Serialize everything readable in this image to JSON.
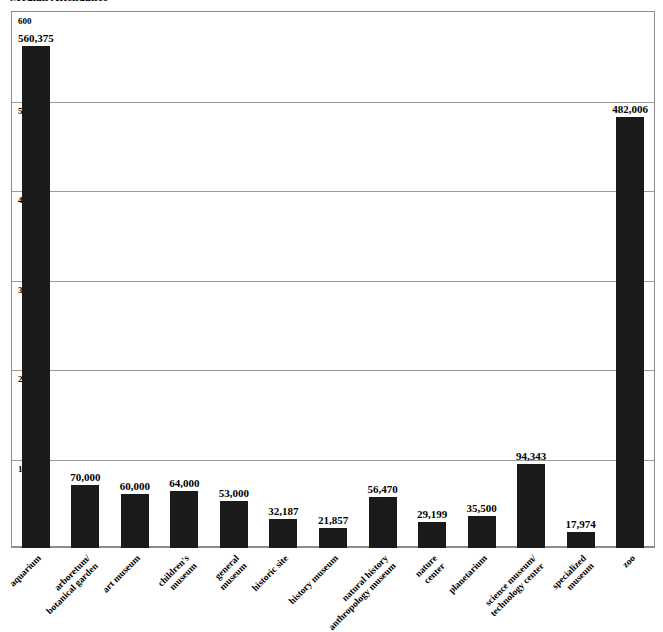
{
  "chart_data": {
    "type": "bar",
    "title": "Median Attendance",
    "xlabel": "",
    "ylabel": "",
    "ylim": [
      0,
      600
    ],
    "y_unit": "thousands",
    "grid": true,
    "legend": "none",
    "y_ticks": [
      "100",
      "200",
      "300",
      "400",
      "500",
      "600"
    ],
    "y_tick_values": [
      100,
      200,
      300,
      400,
      500,
      600
    ],
    "bar_color": "#1a1a1a",
    "categories": [
      "aquarium",
      "arboretum/ botanical garden",
      "art museum",
      "children's museum",
      "general museum",
      "historic site",
      "history museum",
      "natural history anthropology museum",
      "nature center",
      "planetarium",
      "science museum/ technology center",
      "specialized museum",
      "zoo"
    ],
    "category_lines": [
      [
        "aquarium"
      ],
      [
        "arboretum/",
        "botanical garden"
      ],
      [
        "art museum"
      ],
      [
        "children's",
        "museum"
      ],
      [
        "general",
        "museum"
      ],
      [
        "historic site"
      ],
      [
        "history museum"
      ],
      [
        "natural history",
        "anthropology museum"
      ],
      [
        "nature",
        "center"
      ],
      [
        "planetarium"
      ],
      [
        "science museum/",
        "technology center"
      ],
      [
        "specialized",
        "museum"
      ],
      [
        "zoo"
      ]
    ],
    "values": [
      560375,
      70000,
      60000,
      64000,
      53000,
      32187,
      21857,
      56470,
      29199,
      35500,
      94343,
      17974,
      482006
    ],
    "value_labels": [
      "560,375",
      "70,000",
      "60,000",
      "64,000",
      "53,000",
      "32,187",
      "21,857",
      "56,470",
      "29,199",
      "35,500",
      "94,343",
      "17,974",
      "482,006"
    ]
  }
}
